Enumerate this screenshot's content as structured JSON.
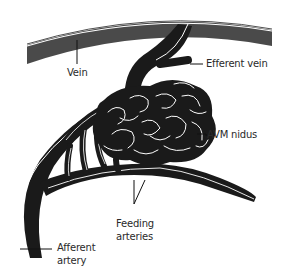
{
  "diagram": {
    "type": "anatomical-illustration",
    "colors": {
      "vessel_fill": "#1a1a1a",
      "vein_band_fill": "#4a4a4a",
      "vessel_highlight": "#ffffff",
      "leader_line": "#111111",
      "label_text": "#2a2a2a",
      "background": "#ffffff"
    },
    "labels": {
      "vein": "Vein",
      "efferent_vein": "Efferent vein",
      "avm_nidus": "AVM nidus",
      "feeding_arteries_line1": "Feeding",
      "feeding_arteries_line2": "arteries",
      "afferent_artery_line1": "Afferent",
      "afferent_artery_line2": "artery"
    }
  }
}
